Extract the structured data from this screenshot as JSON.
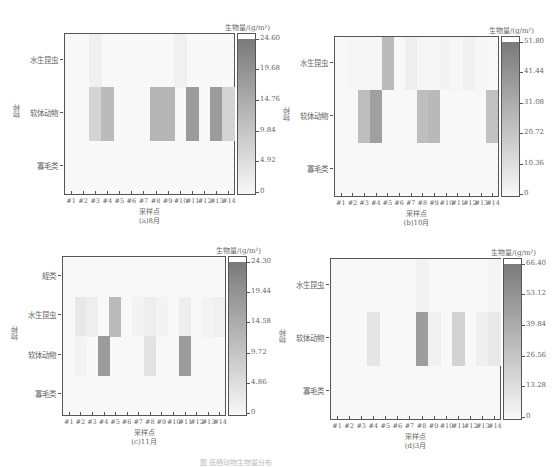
{
  "figure_caption": "图 底栖动物生物量分布",
  "chart_data": [
    {
      "type": "heatmap",
      "subtitle": "(a)8月",
      "xlabel": "采样点",
      "ylabel": "物种",
      "colorbar_title": "生物量/(g/m²)",
      "colorbar_ticks": [
        "0",
        "4.92",
        "9.84",
        "14.76",
        "19.68",
        "24.60"
      ],
      "vmin": 0,
      "vmax": 24.6,
      "categories": [
        "#1",
        "#2",
        "#3",
        "#4",
        "#5",
        "#6",
        "#7",
        "#8",
        "#9",
        "#10",
        "#11",
        "#12",
        "#13",
        "#14"
      ],
      "rows": [
        "水生昆虫",
        "软体动物",
        "寡毛类"
      ],
      "values": [
        [
          0,
          0,
          1.5,
          0,
          0,
          0,
          0,
          0,
          0,
          1.5,
          0,
          0,
          0,
          0
        ],
        [
          0,
          0,
          7,
          12,
          0,
          0,
          0,
          13,
          13,
          0,
          18,
          0,
          18,
          7
        ],
        [
          0,
          0,
          0,
          0,
          0,
          0,
          0,
          0,
          0,
          0,
          0,
          0,
          0,
          0
        ]
      ]
    },
    {
      "type": "heatmap",
      "subtitle": "(b)10月",
      "xlabel": "采样点",
      "ylabel": "物种",
      "colorbar_title": "生物量/(g/m²)",
      "colorbar_ticks": [
        "0",
        "10.36",
        "20.72",
        "31.08",
        "41.44",
        "51.80"
      ],
      "vmin": 0,
      "vmax": 51.8,
      "categories": [
        "#1",
        "#2",
        "#3",
        "#4",
        "#5",
        "#6",
        "#7",
        "#8",
        "#9",
        "#10",
        "#11",
        "#12",
        "#13",
        "#14"
      ],
      "rows": [
        "水生昆虫",
        "软体动物",
        "寡毛类"
      ],
      "values": [
        [
          0,
          1,
          1,
          1,
          25,
          0,
          4,
          1,
          1,
          2,
          1,
          3,
          1,
          0
        ],
        [
          0,
          0,
          24,
          36,
          0,
          0,
          0,
          24,
          26,
          0,
          0,
          0,
          0,
          22
        ],
        [
          0,
          0,
          0,
          0,
          0,
          0,
          0,
          0,
          0,
          0,
          0,
          0,
          0,
          0
        ]
      ]
    },
    {
      "type": "heatmap",
      "subtitle": "(c)11月",
      "xlabel": "采样点",
      "ylabel": "物种",
      "colorbar_title": "生物量/(g/m²)",
      "colorbar_ticks": [
        "0",
        "4.86",
        "9.72",
        "14.58",
        "19.44",
        "24.30"
      ],
      "vmin": 0,
      "vmax": 24.3,
      "categories": [
        "#1",
        "#2",
        "#3",
        "#4",
        "#5",
        "#6",
        "#7",
        "#8",
        "#9",
        "#10",
        "#11",
        "#12",
        "#13",
        "#14"
      ],
      "rows": [
        "蛭类",
        "水生昆虫",
        "软体动物",
        "寡毛类"
      ],
      "values": [
        [
          0,
          0,
          0,
          0,
          0,
          0,
          0,
          0,
          0,
          0,
          0,
          0,
          0,
          0
        ],
        [
          0,
          3,
          2,
          0,
          12,
          0,
          1,
          2,
          1,
          0,
          2,
          0,
          1,
          1.5
        ],
        [
          0,
          1,
          0,
          18,
          0,
          0,
          0,
          4,
          0,
          0,
          18,
          0,
          0,
          0
        ],
        [
          0,
          0,
          0,
          0,
          0,
          0,
          0,
          0,
          0,
          0,
          0,
          0,
          0,
          0
        ]
      ]
    },
    {
      "type": "heatmap",
      "subtitle": "(d)3月",
      "xlabel": "采样点",
      "ylabel": "物种",
      "colorbar_title": "生物量/(g/m²)",
      "colorbar_ticks": [
        "0",
        "13.28",
        "26.56",
        "39.84",
        "53.12",
        "66.40"
      ],
      "vmin": 0,
      "vmax": 66.4,
      "categories": [
        "#1",
        "#2",
        "#3",
        "#4",
        "#5",
        "#6",
        "#7",
        "#8",
        "#9",
        "#10",
        "#11",
        "#12",
        "#13",
        "#14"
      ],
      "rows": [
        "水生昆虫",
        "软体动物",
        "寡毛类"
      ],
      "values": [
        [
          0,
          0,
          0,
          0,
          0,
          0,
          0,
          3,
          0,
          0,
          0,
          0,
          0,
          2
        ],
        [
          0,
          0,
          0,
          10,
          0,
          0,
          0,
          48,
          4,
          0,
          20,
          0,
          5,
          8
        ],
        [
          0,
          0,
          0,
          0,
          0,
          0,
          0,
          0,
          0,
          0,
          0,
          0,
          0,
          0
        ]
      ]
    }
  ]
}
